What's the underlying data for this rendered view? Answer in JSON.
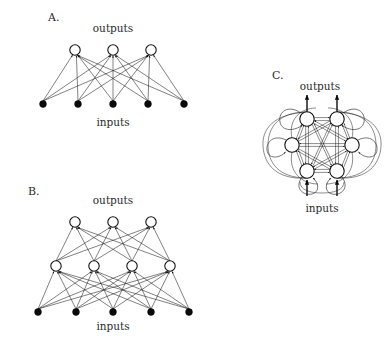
{
  "figure": {
    "background_color": "#ffffff",
    "ink_color": "#1a1a1a",
    "width": 390,
    "height": 355
  },
  "panels": [
    {
      "id": "A",
      "letter": "A.",
      "letter_pos": {
        "x": 48,
        "y": 21
      },
      "type": "feedforward-single-layer",
      "top_label": "outputs",
      "top_label_pos": {
        "x": 113,
        "y": 32
      },
      "bottom_label": "inputs",
      "bottom_label_pos": {
        "x": 113,
        "y": 126
      },
      "layers": [
        {
          "name": "output-layer",
          "node_style": "open-circle",
          "radius": 5.2,
          "y": 50,
          "nodes": [
            {
              "x": 75,
              "label": "output-node-1"
            },
            {
              "x": 113,
              "label": "output-node-2"
            },
            {
              "x": 151,
              "label": "output-node-3"
            }
          ]
        },
        {
          "name": "input-layer",
          "node_style": "filled-dot",
          "radius": 3.4,
          "y": 104,
          "nodes": [
            {
              "x": 43,
              "label": "input-node-1"
            },
            {
              "x": 78,
              "label": "input-node-2"
            },
            {
              "x": 113,
              "label": "input-node-3"
            },
            {
              "x": 148,
              "label": "input-node-4"
            },
            {
              "x": 184,
              "label": "input-node-5"
            }
          ]
        }
      ],
      "connectivity": "full-bipartite-input-to-output",
      "arrowheads": true,
      "edge_count": 15
    },
    {
      "id": "B",
      "letter": "B.",
      "letter_pos": {
        "x": 28,
        "y": 195
      },
      "type": "feedforward-two-layer",
      "top_label": "outputs",
      "top_label_pos": {
        "x": 113,
        "y": 204
      },
      "bottom_label": "inputs",
      "bottom_label_pos": {
        "x": 113,
        "y": 330
      },
      "layers": [
        {
          "name": "output-layer",
          "node_style": "open-circle",
          "radius": 5.2,
          "y": 222,
          "nodes": [
            {
              "x": 75,
              "label": "output-node-1"
            },
            {
              "x": 113,
              "label": "output-node-2"
            },
            {
              "x": 151,
              "label": "output-node-3"
            }
          ]
        },
        {
          "name": "hidden-layer",
          "node_style": "open-circle",
          "radius": 5.2,
          "y": 266,
          "nodes": [
            {
              "x": 56,
              "label": "hidden-node-1"
            },
            {
              "x": 94,
              "label": "hidden-node-2"
            },
            {
              "x": 132,
              "label": "hidden-node-3"
            },
            {
              "x": 170,
              "label": "hidden-node-4"
            }
          ]
        },
        {
          "name": "input-layer",
          "node_style": "filled-dot",
          "radius": 3.4,
          "y": 312,
          "nodes": [
            {
              "x": 38,
              "label": "input-node-1"
            },
            {
              "x": 76,
              "label": "input-node-2"
            },
            {
              "x": 113,
              "label": "input-node-3"
            },
            {
              "x": 151,
              "label": "input-node-4"
            },
            {
              "x": 189,
              "label": "input-node-5"
            }
          ]
        }
      ],
      "connectivity": "full-bipartite-input-to-hidden-and-hidden-to-output",
      "arrowheads": true,
      "edge_count": 32
    },
    {
      "id": "C",
      "letter": "C.",
      "letter_pos": {
        "x": 272,
        "y": 79
      },
      "type": "fully-recurrent",
      "top_label": "outputs",
      "top_label_pos": {
        "x": 320,
        "y": 90
      },
      "bottom_label": "inputs",
      "bottom_label_pos": {
        "x": 322,
        "y": 212
      },
      "ring": {
        "center": {
          "x": 322,
          "y": 145
        },
        "radius_x": 30,
        "radius_y": 32,
        "node_radius": 7.2,
        "node_style": "open-circle",
        "self_loops": true,
        "nodes": [
          {
            "x": 307,
            "y": 119,
            "label": "unit-1"
          },
          {
            "x": 337,
            "y": 119,
            "label": "unit-2"
          },
          {
            "x": 352,
            "y": 145,
            "label": "unit-3"
          },
          {
            "x": 337,
            "y": 171,
            "label": "unit-4"
          },
          {
            "x": 307,
            "y": 171,
            "label": "unit-5"
          },
          {
            "x": 292,
            "y": 145,
            "label": "unit-6"
          }
        ]
      },
      "external_outputs": [
        {
          "x": 307,
          "y_from": 112,
          "y_to": 95,
          "label": "output-arrow-1"
        },
        {
          "x": 337,
          "y_from": 112,
          "y_to": 95,
          "label": "output-arrow-2"
        }
      ],
      "external_inputs": [
        {
          "x": 307,
          "y_from": 196,
          "y_to": 179,
          "label": "input-arrow-1"
        },
        {
          "x": 337,
          "y_from": 196,
          "y_to": 179,
          "label": "input-arrow-2"
        }
      ],
      "connectivity": "all-to-all-bidirectional-plus-self-connections",
      "arrowheads": true,
      "unit_count": 6
    }
  ]
}
